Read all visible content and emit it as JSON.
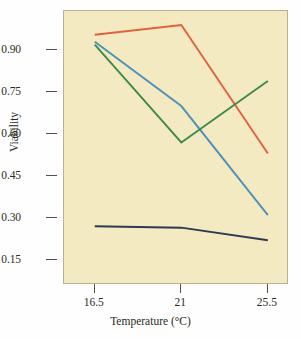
{
  "chart_data": {
    "type": "line",
    "title": "",
    "xlabel": "Temperature (°C)",
    "ylabel": "Viability",
    "x": [
      16.5,
      21,
      25.5
    ],
    "xtick_labels": [
      "16.5",
      "21",
      "25.5"
    ],
    "ytick_labels": [
      "0.90",
      "0.75",
      "0.60",
      "0.45",
      "0.30",
      "0.15"
    ],
    "yticks": [
      0.9,
      0.75,
      0.6,
      0.45,
      0.3,
      0.15
    ],
    "ylim": [
      0.06,
      1.04
    ],
    "xlim": [
      14.9,
      26.6
    ],
    "grid": false,
    "legend": "none",
    "plot_background": "#F3EAC1",
    "series": [
      {
        "name": "orange-series",
        "color": "#E0613C",
        "values": [
          0.955,
          0.99,
          0.53
        ]
      },
      {
        "name": "blue-series",
        "color": "#4B93BC",
        "values": [
          0.93,
          0.7,
          0.31
        ]
      },
      {
        "name": "green-series",
        "color": "#3E8A4D",
        "values": [
          0.92,
          0.57,
          0.79
        ]
      },
      {
        "name": "navy-series",
        "color": "#2B3A55",
        "values": [
          0.27,
          0.265,
          0.22
        ]
      }
    ]
  },
  "axes": {
    "y_title": "Viability",
    "x_title": "Temperature (°C)"
  }
}
